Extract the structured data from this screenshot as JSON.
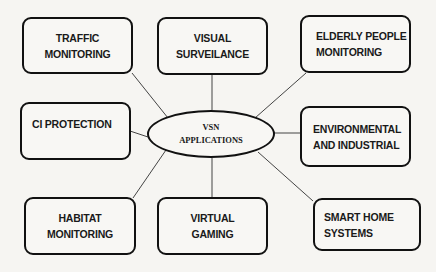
{
  "diagram": {
    "title": "VSN Applications",
    "center": {
      "label": "VSN\nAPPLICATIONS"
    },
    "nodes": [
      {
        "id": "traffic-monitoring",
        "label": "TRAFFIC\nMONITORING"
      },
      {
        "id": "visual-surveillance",
        "label": "VISUAL\nSURVEILANCE"
      },
      {
        "id": "elderly-people-monitoring",
        "label": "ELDERLY PEOPLE\nMONITORING"
      },
      {
        "id": "ci-protection",
        "label": "CI PROTECTION"
      },
      {
        "id": "environmental-and-industrial",
        "label": "ENVIRONMENTAL\nAND INDUSTRIAL"
      },
      {
        "id": "habitat-monitoring",
        "label": "HABITAT\nMONITORING"
      },
      {
        "id": "virtual-gaming",
        "label": "VIRTUAL\nGAMING"
      },
      {
        "id": "smart-home-systems",
        "label": "SMART HOME\nSYSTEMS"
      }
    ],
    "edges": [
      [
        "VSN APPLICATIONS",
        "TRAFFIC MONITORING"
      ],
      [
        "VSN APPLICATIONS",
        "VISUAL SURVEILANCE"
      ],
      [
        "VSN APPLICATIONS",
        "ELDERLY PEOPLE MONITORING"
      ],
      [
        "VSN APPLICATIONS",
        "CI PROTECTION"
      ],
      [
        "VSN APPLICATIONS",
        "ENVIRONMENTAL AND INDUSTRIAL"
      ],
      [
        "VSN APPLICATIONS",
        "HABITAT MONITORING"
      ],
      [
        "VSN APPLICATIONS",
        "VIRTUAL GAMING"
      ],
      [
        "VSN APPLICATIONS",
        "SMART HOME SYSTEMS"
      ]
    ],
    "colors": {
      "background": "#f6f5f2",
      "stroke": "#111111",
      "connector": "#444444",
      "text": "#1a1a1a"
    }
  }
}
